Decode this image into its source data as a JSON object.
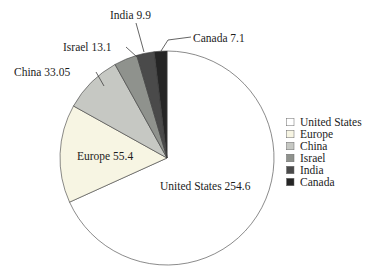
{
  "chart_data": {
    "type": "pie",
    "title": "",
    "total": 373.15,
    "start_angle_deg": 0,
    "direction": "clockwise",
    "legend_position": "right",
    "slices": [
      {
        "label": "United States",
        "value": 254.6,
        "color": "#ffffff",
        "callout": "United States 254.6"
      },
      {
        "label": "Europe",
        "value": 55.4,
        "color": "#f7f5e3",
        "callout": "Europe 55.4"
      },
      {
        "label": "China",
        "value": 33.05,
        "color": "#c6c8c3",
        "callout": "China 33.05"
      },
      {
        "label": "Israel",
        "value": 13.1,
        "color": "#8f928d",
        "callout": "Israel 13.1"
      },
      {
        "label": "India",
        "value": 9.9,
        "color": "#4a4a4a",
        "callout": "India 9.9"
      },
      {
        "label": "Canada",
        "value": 7.1,
        "color": "#252525",
        "callout": "Canada 7.1"
      }
    ],
    "legend_entries": [
      "United States",
      "Europe",
      "China",
      "Israel",
      "India",
      "Canada"
    ],
    "colors": {
      "outline": "#3d3d3d",
      "leader_line": "#3d3d3d",
      "text": "#1c1c1c",
      "background": "#ffffff"
    }
  }
}
